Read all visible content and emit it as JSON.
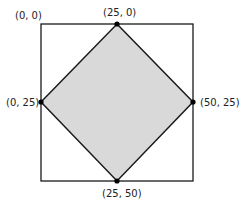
{
  "diagram": {
    "type": "square-with-inscribed-diamond",
    "colors": {
      "outline": "#1a1a1a",
      "fill": "#d9d9d9",
      "vertex": "#000000",
      "background": "#ffffff"
    },
    "labels": {
      "top_left": "(0, 0)",
      "top": "(25, 0)",
      "left": "(0, 25)",
      "right": "(50, 25)",
      "bottom": "(25, 50)"
    }
  }
}
